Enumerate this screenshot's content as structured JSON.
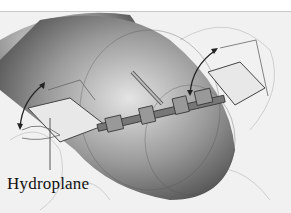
{
  "figure": {
    "callouts": [
      {
        "label": "Hydroplane"
      }
    ]
  },
  "colors": {
    "hull_dark": "#3a3a3a",
    "hull_light": "#e0e0e0",
    "background": "#f1f1f1",
    "plane_fill": "#e8e8e8"
  }
}
